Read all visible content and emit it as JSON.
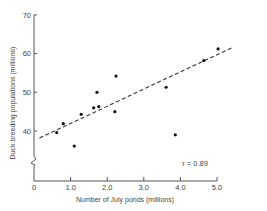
{
  "chart_data": {
    "type": "scatter",
    "title": "",
    "xlabel": "Number of July ponds (millions)",
    "ylabel": "Duck breeding populations (millions)",
    "xlim": [
      0,
      5.0
    ],
    "ylim": [
      30,
      70
    ],
    "x_ticks": [
      0,
      1.0,
      2.0,
      3.0,
      4.0,
      5.0
    ],
    "x_tick_labels": [
      "0",
      "1.0",
      "2.0",
      "3.0",
      "4.0",
      "5.0"
    ],
    "y_ticks": [
      40,
      50,
      60,
      70
    ],
    "y_tick_labels": [
      "40",
      "50",
      "60",
      "70"
    ],
    "y_axis_break": true,
    "grid": false,
    "legend": null,
    "series": [
      {
        "name": "Observations",
        "x": [
          0.62,
          0.8,
          1.1,
          1.29,
          1.63,
          1.77,
          1.72,
          2.24,
          2.21,
          3.61,
          3.86,
          4.64,
          5.03
        ],
        "y": [
          39.6,
          41.9,
          36.1,
          44.3,
          46.0,
          46.3,
          50.0,
          54.2,
          45.0,
          51.3,
          39.0,
          58.2,
          61.2
        ]
      }
    ],
    "regression_line": {
      "style": "dashed",
      "x": [
        0.15,
        5.43
      ],
      "y": [
        38.2,
        61.6
      ]
    },
    "annotations": [
      {
        "text": "r = 0.89",
        "x": 4.2,
        "y": 34.2
      }
    ]
  },
  "labels": {
    "xlabel": "Number of July ponds (millions)",
    "ylabel": "Duck breeding populations (millions)",
    "r_label": "r = 0.89",
    "x_ticks": [
      "0",
      "1.0",
      "2.0",
      "3.0",
      "4.0",
      "5.0"
    ],
    "y_ticks": [
      "40",
      "50",
      "60",
      "70"
    ]
  },
  "colors": {
    "axis": "#555555",
    "points": "#111111",
    "line": "#333333",
    "text": "#444444"
  }
}
